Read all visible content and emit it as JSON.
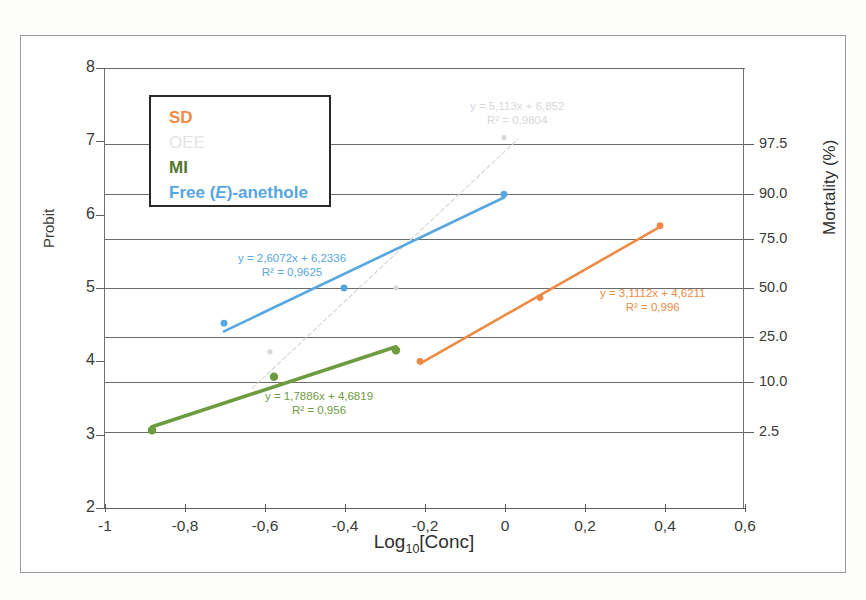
{
  "chart_data": {
    "type": "scatter",
    "title": "",
    "xlabel": "Log10[Conc]",
    "xlabel_base": "Log",
    "xlabel_sub": "10",
    "xlabel_rest": "[Conc]",
    "ylabel": "Probit",
    "ylabel_right": "Mortality (%)",
    "xlim": [
      -1,
      0.6
    ],
    "ylim": [
      2,
      8
    ],
    "xticks": [
      -1,
      -0.8,
      -0.6,
      -0.4,
      -0.2,
      0,
      0.2,
      0.4,
      0.6
    ],
    "xticklabels": [
      "-1",
      "-0,8",
      "-0,6",
      "-0,4",
      "-0,2",
      "0",
      "0,2",
      "0,4",
      "0,6"
    ],
    "yticks": [
      2,
      3,
      4,
      5,
      6,
      7,
      8
    ],
    "yticklabels": [
      "2",
      "3",
      "4",
      "5",
      "6",
      "7",
      "8"
    ],
    "right_axis": {
      "probit_positions": [
        6.96,
        6.28,
        5.67,
        5.0,
        4.33,
        3.72,
        3.04
      ],
      "labels": [
        "97.5",
        "90.0",
        "75.0",
        "50.0",
        "25.0",
        "10.0",
        "2.5"
      ]
    },
    "grid": true,
    "grid_axis": "y",
    "legend_position": "upper-left",
    "series": [
      {
        "name": "SD",
        "color": "#ED8B45",
        "points": [
          [
            -0.21,
            4.0
          ],
          [
            0.09,
            4.87
          ],
          [
            0.39,
            5.85
          ]
        ],
        "fit": {
          "slope": 3.1112,
          "intercept": 4.6211,
          "r2": 0.996
        },
        "equation": "y = 3,1112x + 4,6211",
        "r2_text": "R² = 0,996"
      },
      {
        "name": "OEE",
        "color": "#D8D8D8",
        "points": [
          [
            -0.585,
            4.13
          ],
          [
            -0.27,
            5.0
          ],
          [
            0.0,
            7.05
          ]
        ],
        "fit": {
          "slope": 5.113,
          "intercept": 6.852,
          "r2": 0.9804
        },
        "equation": "y = 5,113x + 6,852",
        "r2_text": "R² = 0,9804"
      },
      {
        "name": "MI",
        "color": "#6D9B3F",
        "points": [
          [
            -0.88,
            3.06
          ],
          [
            -0.575,
            3.79
          ],
          [
            -0.27,
            4.15
          ]
        ],
        "fit": {
          "slope": 1.7886,
          "intercept": 4.6819,
          "r2": 0.956
        },
        "equation": "y = 1,7886x + 4,6819",
        "r2_text": "R² = 0,956"
      },
      {
        "name": "Free (E)-anethole",
        "name_pre": "Free (",
        "name_italic": "E",
        "name_post": ")-anethole",
        "color": "#56A7E0",
        "points": [
          [
            -0.7,
            4.52
          ],
          [
            -0.4,
            5.0
          ],
          [
            0.0,
            6.28
          ]
        ],
        "fit": {
          "slope": 2.6072,
          "intercept": 6.2336,
          "r2": 0.9625
        },
        "equation": "y = 2,6072x + 6,2336",
        "r2_text": "R² = 0,9625"
      }
    ]
  },
  "legend": {
    "items": [
      {
        "label": "SD",
        "color": "#ED8B45"
      },
      {
        "label": "OEE",
        "color": "#E4E4E4"
      },
      {
        "label": "MI",
        "color": "#55762F"
      },
      {
        "label": "Free (E)-anethole",
        "color": "#56A7E0"
      }
    ]
  }
}
